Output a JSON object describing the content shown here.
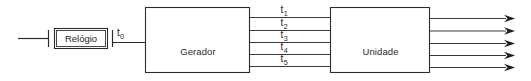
{
  "diagram": {
    "background_color": "#ffffff",
    "line_color": "#2b2b2b",
    "text_color": "#1f1f1f",
    "blocks": [
      {
        "id": "relogio",
        "label": "Relógio",
        "x": 55,
        "y": 29,
        "width": 52,
        "height": 19
      },
      {
        "id": "gerador-de-tempo",
        "label_line1": "Gerador",
        "label_line2": "de",
        "label_line3": "tempo",
        "x": 145,
        "y": 7,
        "width": 105,
        "height": 66
      },
      {
        "id": "unidade-de-controle",
        "label_line1": "Unidade",
        "label_line2": "de",
        "label_line3": "controle",
        "x": 330,
        "y": 7,
        "width": 100,
        "height": 66
      }
    ],
    "signals": {
      "clock_output": {
        "base": "t",
        "subscript": "0"
      },
      "timing_lines": [
        {
          "base": "t",
          "subscript": "1"
        },
        {
          "base": "t",
          "subscript": "2"
        },
        {
          "base": "t",
          "subscript": "3"
        },
        {
          "base": "t",
          "subscript": "4"
        },
        {
          "base": "t",
          "subscript": "5"
        }
      ]
    },
    "output_arrow_count": 5
  }
}
